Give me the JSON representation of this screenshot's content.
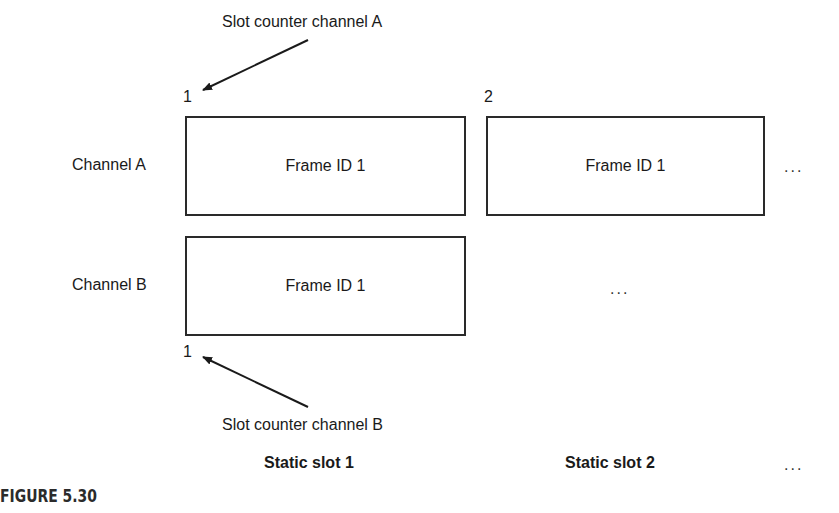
{
  "diagram": {
    "annotations": {
      "counter_a": "Slot counter channel A",
      "counter_b": "Slot counter channel B"
    },
    "slot_numbers": {
      "a_slot1": "1",
      "a_slot2": "2",
      "b_slot1": "1"
    },
    "channels": [
      {
        "label": "Channel A",
        "frames": [
          "Frame ID 1",
          "Frame ID 1"
        ],
        "continuation": "..."
      },
      {
        "label": "Channel B",
        "frames": [
          "Frame ID 1"
        ],
        "empty_slot": "..."
      }
    ],
    "static_slots": [
      "Static slot 1",
      "Static slot 2"
    ],
    "static_slots_continuation": "...",
    "caption": "FIGURE 5.30",
    "colors": {
      "stroke": "#2a2a2a",
      "text": "#1a1a1a",
      "background": "#ffffff"
    }
  }
}
